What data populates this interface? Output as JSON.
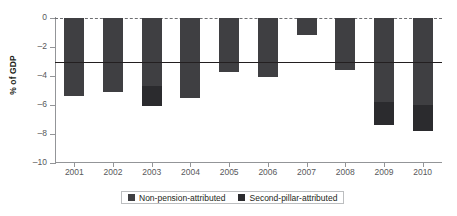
{
  "chart_data": {
    "type": "bar",
    "title": "",
    "xlabel": "",
    "ylabel": "% of GDP",
    "ylim": [
      -10,
      0
    ],
    "yticks": [
      0,
      -2,
      -4,
      -6,
      -8,
      -10
    ],
    "ytick_labels": [
      "0",
      "–2",
      "–4",
      "–6",
      "–8",
      "–10"
    ],
    "grid": false,
    "stacked": true,
    "legend_position": "bottom-center",
    "categories": [
      "2001",
      "2002",
      "2003",
      "2004",
      "2005",
      "2006",
      "2007",
      "2008",
      "2009",
      "2010"
    ],
    "series": [
      {
        "name": "Non-pension-attributed",
        "color": "#3f3f42",
        "values": [
          -5.4,
          -5.1,
          -4.7,
          -5.5,
          -3.7,
          -4.1,
          -1.2,
          -3.6,
          -5.8,
          -6.0
        ]
      },
      {
        "name": "Second-pillar-attributed",
        "color": "#2b2b2e",
        "values": [
          0.0,
          0.0,
          -1.4,
          0.0,
          0.0,
          0.0,
          0.0,
          0.0,
          -1.6,
          -1.8
        ]
      }
    ],
    "totals": [
      -5.4,
      -5.1,
      -6.1,
      -5.5,
      -3.7,
      -4.1,
      -1.2,
      -3.6,
      -7.4,
      -7.8
    ],
    "reference_line": {
      "label": "",
      "value": -3.0,
      "color": "#231f20"
    },
    "zero_line": {
      "value": 0,
      "style": "dashed",
      "color": "#6d6e71"
    },
    "axis_color": "#939598"
  },
  "legend": {
    "entries": [
      {
        "label": "Non-pension-attributed",
        "color": "#3f3f42"
      },
      {
        "label": "Second-pillar-attributed",
        "color": "#2b2b2e"
      }
    ]
  }
}
